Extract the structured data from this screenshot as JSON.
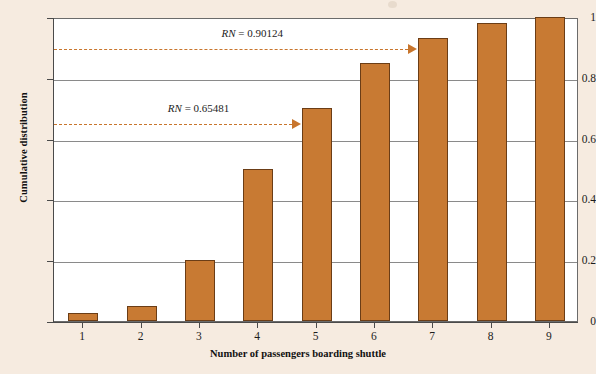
{
  "chart_data": {
    "type": "bar",
    "title": "",
    "xlabel": "Number of passengers boarding shuttle",
    "ylabel": "Cumulative distribution",
    "categories": [
      "1",
      "2",
      "3",
      "4",
      "5",
      "6",
      "7",
      "8",
      "9"
    ],
    "values": [
      0.025,
      0.05,
      0.2,
      0.5,
      0.7,
      0.85,
      0.93,
      0.98,
      1.0
    ],
    "ylim": [
      0,
      1
    ],
    "ytick_labels": [
      "0",
      "0.2",
      "0.4",
      "0.6",
      "0.8",
      "1"
    ],
    "ytick_values": [
      0,
      0.2,
      0.4,
      0.6,
      0.8,
      1
    ],
    "xtick_labels": [
      "1",
      "2",
      "3",
      "4",
      "5",
      "6",
      "7",
      "8",
      "9"
    ],
    "grid": true,
    "legend": "none",
    "bar_color": "#c87a33",
    "bar_edge_color": "#6b3d16",
    "annotation_color": "#c8752c",
    "background_color": "#f6ebe0",
    "plot_background_color": "#ffffff",
    "annotations": [
      {
        "name": "rn-high",
        "label": "RN = 0.90124",
        "label_prefix": "RN",
        "label_value": "= 0.90124",
        "y": 0.90124,
        "points_to_category": "7",
        "style": "dashed-arrow"
      },
      {
        "name": "rn-low",
        "label": "RN = 0.65481",
        "label_prefix": "RN",
        "label_value": "= 0.65481",
        "y": 0.65481,
        "points_to_category": "5",
        "style": "dashed-arrow"
      }
    ]
  }
}
